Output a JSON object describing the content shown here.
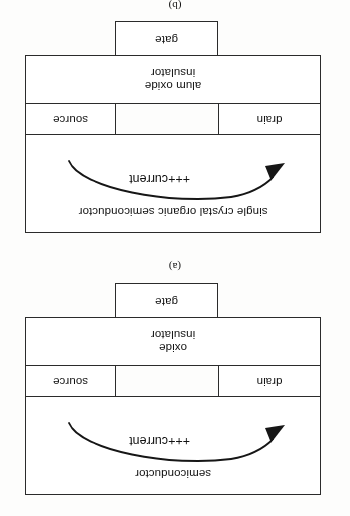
{
  "document": {
    "type": "scanned-figure-page",
    "orientation": "upside-down",
    "rotation_degrees": 180,
    "background_color": "#fdfdfc",
    "ink_color": "#2b2b2b"
  },
  "figures": [
    {
      "id": "figure-a",
      "caption": "(a)",
      "layers": {
        "semiconductor": "semiconductor",
        "drain": "drain",
        "source": "source",
        "insulator": "oxide\ninsulator",
        "gate": "gate"
      },
      "annotation": {
        "arrow_label": "+++current",
        "arrow_direction": "source-to-drain"
      }
    },
    {
      "id": "figure-b",
      "caption": "(b)",
      "layers": {
        "semiconductor": "single crystal organic semiconductor",
        "drain": "drain",
        "source": "source",
        "insulator": "alum oxide\ninsulator",
        "gate": "gate"
      },
      "annotation": {
        "arrow_label": "+++current",
        "arrow_direction": "source-to-drain"
      }
    }
  ]
}
